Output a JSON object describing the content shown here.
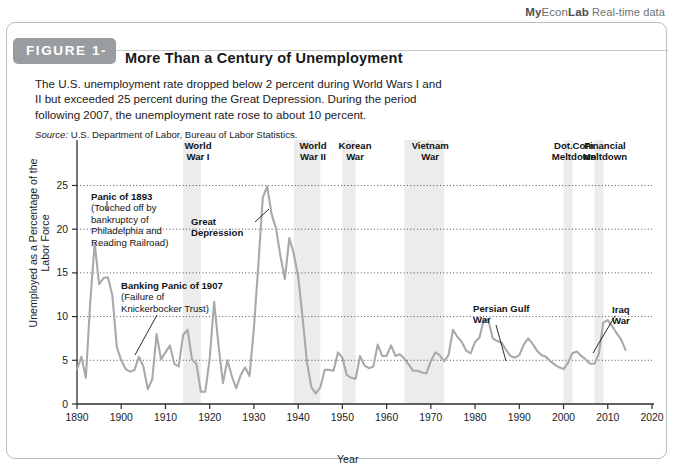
{
  "brand": {
    "my": "My",
    "econ": "Econ",
    "lab": "Lab",
    "realtime": "Real-time data"
  },
  "figure": {
    "badge": "FIGURE 1-1",
    "title": "More Than a Century of Unemployment",
    "blurb": "The U.S. unemployment rate dropped below 2 percent during World Wars I and II but exceeded 25 percent during the Great Depression. During the period following 2007, the unemployment rate rose to about 10 percent.",
    "source_label": "Source:",
    "source_text": "U.S. Department of Labor, Bureau of Labor Statistics."
  },
  "chart_data": {
    "type": "line",
    "title": "More Than a Century of Unemployment",
    "xlabel": "Year",
    "ylabel": "Unemployed as a Percentage of the Labor Force",
    "xlim": [
      1890,
      2020
    ],
    "ylim": [
      0,
      27
    ],
    "xticks": [
      1890,
      1900,
      1910,
      1920,
      1930,
      1940,
      1950,
      1960,
      1970,
      1980,
      1990,
      2000,
      2010,
      2020
    ],
    "yticks": [
      0,
      5,
      10,
      15,
      20,
      25
    ],
    "grid": "horizontal-dotted",
    "legend": "none",
    "line_color": "#a7a9ac",
    "band_color": "#ececec",
    "series": [
      {
        "name": "U.S. Unemployment Rate",
        "x": [
          1890,
          1891,
          1892,
          1893,
          1894,
          1895,
          1896,
          1897,
          1898,
          1899,
          1900,
          1901,
          1902,
          1903,
          1904,
          1905,
          1906,
          1907,
          1908,
          1909,
          1910,
          1911,
          1912,
          1913,
          1914,
          1915,
          1916,
          1917,
          1918,
          1919,
          1920,
          1921,
          1922,
          1923,
          1924,
          1925,
          1926,
          1927,
          1928,
          1929,
          1930,
          1931,
          1932,
          1933,
          1934,
          1935,
          1936,
          1937,
          1938,
          1939,
          1940,
          1941,
          1942,
          1943,
          1944,
          1945,
          1946,
          1947,
          1948,
          1949,
          1950,
          1951,
          1952,
          1953,
          1954,
          1955,
          1956,
          1957,
          1958,
          1959,
          1960,
          1961,
          1962,
          1963,
          1964,
          1965,
          1966,
          1967,
          1968,
          1969,
          1970,
          1971,
          1972,
          1973,
          1974,
          1975,
          1976,
          1977,
          1978,
          1979,
          1980,
          1981,
          1982,
          1983,
          1984,
          1985,
          1986,
          1987,
          1988,
          1989,
          1990,
          1991,
          1992,
          1993,
          1994,
          1995,
          1996,
          1997,
          1998,
          1999,
          2000,
          2001,
          2002,
          2003,
          2004,
          2005,
          2006,
          2007,
          2008,
          2009,
          2010,
          2011,
          2012,
          2013,
          2014
        ],
        "values": [
          4.0,
          5.4,
          3.0,
          11.7,
          18.4,
          13.7,
          14.4,
          14.5,
          12.4,
          6.5,
          5.0,
          4.0,
          3.7,
          3.9,
          5.4,
          4.3,
          1.7,
          2.8,
          8.0,
          5.1,
          5.9,
          6.7,
          4.6,
          4.3,
          7.9,
          8.5,
          5.1,
          4.6,
          1.4,
          1.4,
          5.2,
          11.7,
          6.7,
          2.4,
          5.0,
          3.2,
          1.8,
          3.3,
          4.2,
          3.2,
          8.7,
          15.9,
          23.6,
          24.9,
          21.7,
          20.1,
          16.9,
          14.3,
          19.0,
          17.2,
          14.6,
          9.9,
          4.7,
          1.9,
          1.2,
          1.9,
          3.9,
          3.9,
          3.8,
          5.9,
          5.3,
          3.3,
          3.0,
          2.9,
          5.5,
          4.4,
          4.1,
          4.3,
          6.8,
          5.5,
          5.5,
          6.7,
          5.5,
          5.7,
          5.2,
          4.5,
          3.8,
          3.8,
          3.6,
          3.5,
          4.9,
          5.9,
          5.6,
          4.9,
          5.6,
          8.5,
          7.7,
          7.1,
          6.1,
          5.8,
          7.1,
          7.6,
          9.7,
          9.6,
          7.5,
          7.2,
          7.0,
          6.2,
          5.5,
          5.3,
          5.6,
          6.8,
          7.5,
          6.9,
          6.1,
          5.6,
          5.4,
          4.9,
          4.5,
          4.2,
          4.0,
          4.7,
          5.8,
          6.0,
          5.5,
          5.1,
          4.6,
          4.6,
          5.8,
          9.3,
          9.6,
          8.9,
          8.1,
          7.4,
          6.2
        ]
      }
    ],
    "shaded_bands": [
      {
        "label": "World War I",
        "start": 1914,
        "end": 1918
      },
      {
        "label": "World War II",
        "start": 1939,
        "end": 1945
      },
      {
        "label": "Korean War",
        "start": 1950,
        "end": 1953
      },
      {
        "label": "Vietnam War",
        "start": 1964,
        "end": 1973
      },
      {
        "label": "Dot.Com Meltdown",
        "start": 2000,
        "end": 2002
      },
      {
        "label": "Financial Meltdown",
        "start": 2007,
        "end": 2009
      }
    ],
    "top_labels": [
      {
        "line1": "World",
        "line2": "War I"
      },
      {
        "line1": "World",
        "line2": "War II"
      },
      {
        "line1": "Korean",
        "line2": "War"
      },
      {
        "line1": "Vietnam",
        "line2": "War"
      },
      {
        "line1": "Dot.Com",
        "line2": "Meltdown"
      },
      {
        "line1": "Financial",
        "line2": "Meltdown"
      }
    ],
    "annotations": [
      {
        "title": "Panic of 1893",
        "body_lines": [
          "(Touched off by",
          "bankruptcy of",
          "Philadelphia and",
          "Reading Railroad)"
        ],
        "points_to_year": 1894,
        "points_to_value": 18.4
      },
      {
        "title": "Banking Panic of 1907",
        "body_lines": [
          "(Failure of",
          "Knickerbocker Trust)"
        ],
        "points_to_year": 1908,
        "points_to_value": 8.0
      },
      {
        "title": "Great Depression",
        "body_lines": [],
        "points_to_year": 1933,
        "points_to_value": 24.9
      },
      {
        "title": "Persian Gulf War",
        "body_lines": [],
        "points_to_year": 1992,
        "points_to_value": 7.5
      },
      {
        "title": "Iraq War",
        "body_lines": [],
        "points_to_year": 2003,
        "points_to_value": 6.0
      }
    ]
  }
}
